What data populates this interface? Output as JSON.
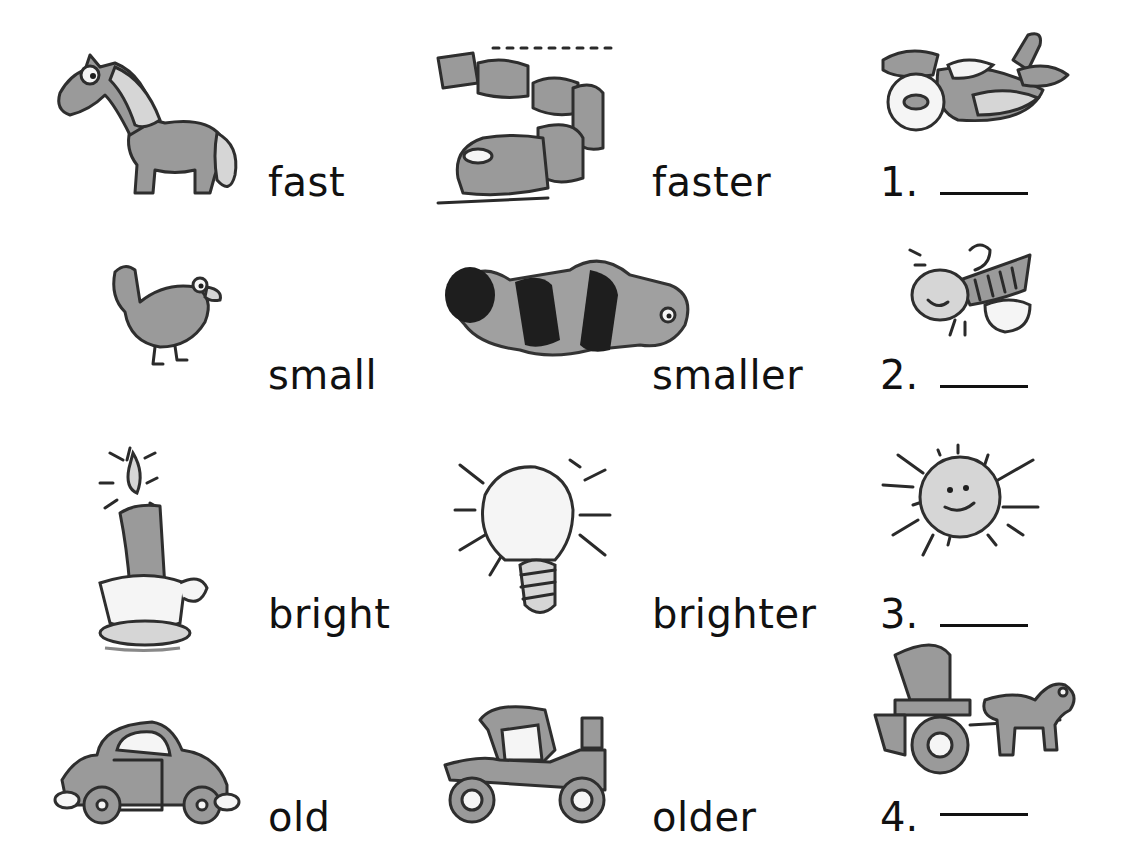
{
  "worksheet": {
    "rows": [
      {
        "base": {
          "word": "fast",
          "picture": "horse"
        },
        "comparative": {
          "word": "faster",
          "picture": "train"
        },
        "exercise": {
          "number": "1.",
          "picture": "airplane",
          "answer": ""
        }
      },
      {
        "base": {
          "word": "small",
          "picture": "hen"
        },
        "comparative": {
          "word": "smaller",
          "picture": "caterpillar"
        },
        "exercise": {
          "number": "2.",
          "picture": "bee",
          "answer": ""
        }
      },
      {
        "base": {
          "word": "bright",
          "picture": "candle"
        },
        "comparative": {
          "word": "brighter",
          "picture": "light bulb"
        },
        "exercise": {
          "number": "3.",
          "picture": "sun",
          "answer": ""
        }
      },
      {
        "base": {
          "word": "old",
          "picture": "car"
        },
        "comparative": {
          "word": "older",
          "picture": "antique car"
        },
        "exercise": {
          "number": "4.",
          "picture": "horse and carriage",
          "answer": ""
        }
      }
    ]
  },
  "colors": {
    "ink": "#111111",
    "fill_gray": "#9a9a9a",
    "fill_light": "#d6d6d6",
    "background": "#ffffff"
  }
}
